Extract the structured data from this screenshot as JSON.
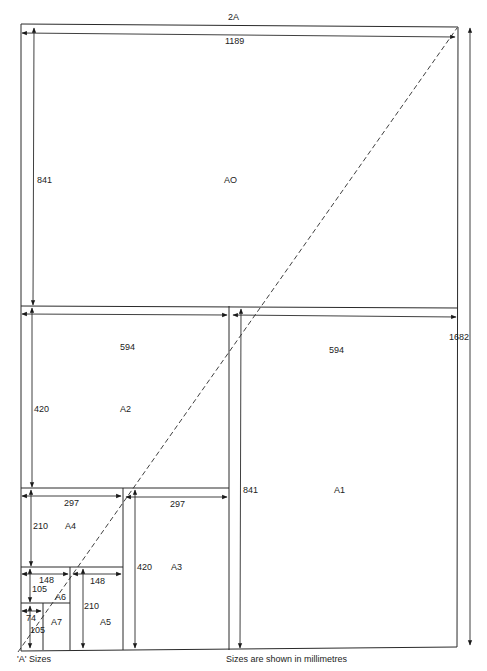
{
  "diagram": {
    "title": "'A' Sizes",
    "note": "Sizes are shown in millimetres",
    "overall": {
      "width_label": "2A",
      "height_label": "1682"
    },
    "sheets": [
      {
        "name": "AO",
        "width": "1189",
        "height": "841"
      },
      {
        "name": "A1",
        "width": "594",
        "height": "841"
      },
      {
        "name": "A2",
        "width": "594",
        "height": "420"
      },
      {
        "name": "A3",
        "width": "297",
        "height": "420"
      },
      {
        "name": "A4",
        "width": "297",
        "height": "210"
      },
      {
        "name": "A5",
        "width": "148",
        "height": "210"
      },
      {
        "name": "A6",
        "width": "148",
        "height": "105"
      },
      {
        "name": "A7",
        "width": "74",
        "height": "105"
      }
    ]
  }
}
